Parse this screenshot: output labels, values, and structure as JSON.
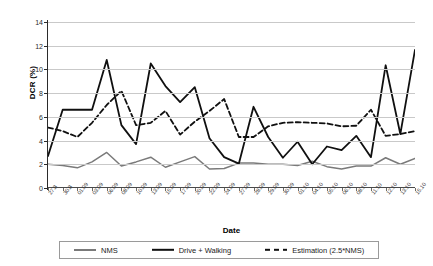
{
  "chart_data": {
    "type": "line",
    "title": "",
    "xlabel": "Date",
    "ylabel": "DCR (%)",
    "ylim": [
      0,
      14
    ],
    "yticks": [
      0,
      2,
      4,
      6,
      8,
      10,
      12,
      14
    ],
    "grid": true,
    "legend_position": "bottom",
    "categories": [
      "27.8",
      "30.8",
      "01.09",
      "03.09",
      "06.09",
      "08.09",
      "10.09",
      "13.09",
      "15.09",
      "17.09",
      "20.09",
      "22.09",
      "24.09",
      "27.09",
      "28.09",
      "29.09",
      "30.09",
      "01.10",
      "04.10",
      "05.10",
      "06.10",
      "08.10",
      "11.10",
      "12.10",
      "13.10",
      "15.10"
    ],
    "series": [
      {
        "name": "NMS",
        "style": "solid",
        "color": "#7a7a7a",
        "values": [
          2.0,
          1.9,
          1.7,
          2.2,
          3.0,
          1.85,
          2.2,
          2.6,
          1.75,
          2.2,
          2.65,
          1.6,
          1.65,
          2.1,
          2.1,
          2.0,
          2.0,
          1.9,
          2.25,
          1.8,
          1.6,
          1.85,
          1.85,
          2.55,
          2.0,
          2.5
        ]
      },
      {
        "name": "Drive + Walking",
        "style": "solid",
        "color": "#101010",
        "values": [
          2.7,
          6.6,
          6.6,
          6.6,
          10.8,
          5.3,
          3.7,
          10.5,
          8.6,
          7.25,
          8.5,
          4.2,
          2.6,
          2.05,
          6.85,
          4.3,
          2.55,
          3.9,
          2.0,
          3.5,
          3.2,
          4.4,
          2.6,
          10.35,
          4.55,
          11.65
        ]
      },
      {
        "name": "Estimation (2.5*NMS)",
        "style": "dashed",
        "color": "#101010",
        "values": [
          5.1,
          4.8,
          4.3,
          5.5,
          7.0,
          8.2,
          5.3,
          5.5,
          6.5,
          4.5,
          5.6,
          6.5,
          7.5,
          4.3,
          4.3,
          5.2,
          5.5,
          5.55,
          5.5,
          5.45,
          5.2,
          5.25,
          6.6,
          4.4,
          4.55,
          4.8
        ]
      }
    ],
    "series_extra_points": {
      "Drive + Walking_end": 8.5,
      "Estimation (2.5*NMS)_end": 6.45
    }
  },
  "legend": {
    "items": [
      {
        "label": "NMS",
        "style": "solid-gray"
      },
      {
        "label": "Drive + Walking",
        "style": "solid-black"
      },
      {
        "label": "Estimation (2.5*NMS)",
        "style": "dashed-black"
      }
    ]
  }
}
